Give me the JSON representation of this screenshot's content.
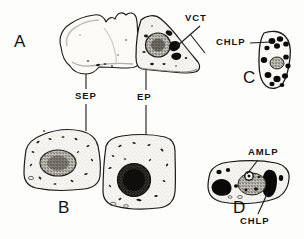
{
  "figure": {
    "caption_present": false,
    "background_color": "#fdfdfc",
    "ink_color": "#141414",
    "panels": [
      {
        "id": "A",
        "letter": "A",
        "letter_x": 14,
        "letter_y": 32,
        "description": "Pair of adjacent epidermal cells in surface view"
      },
      {
        "id": "B",
        "letter": "B",
        "letter_x": 58,
        "letter_y": 198,
        "description": "Subsidiary epidermal cell enlarged"
      },
      {
        "id": "C",
        "letter": "C",
        "letter_x": 243,
        "letter_y": 68,
        "description": "Elongated cell packed with chloroplasts"
      },
      {
        "id": "D",
        "letter": "D",
        "letter_x": 233,
        "letter_y": 198,
        "description": "Elongated cell with amyloplasts and chloroplasts"
      }
    ],
    "labels": [
      {
        "id": "sep",
        "text": "SEP",
        "x": 75,
        "y": 94,
        "leader": "vertical-double"
      },
      {
        "id": "ep",
        "text": "EP",
        "x": 137,
        "y": 96,
        "leader": "vertical-double"
      },
      {
        "id": "vct",
        "text": "VCT",
        "x": 185,
        "y": 14,
        "leader": "diagonal-down-left"
      },
      {
        "id": "chlp-c",
        "text": "CHLP",
        "x": 222,
        "y": 38,
        "leader": "horizontal-right"
      },
      {
        "id": "amlp",
        "text": "AMLP",
        "x": 248,
        "y": 148,
        "leader": "diagonal-down-left"
      },
      {
        "id": "chlp-d",
        "text": "CHLP",
        "x": 243,
        "y": 220,
        "leader": "diagonal-up-right"
      }
    ]
  }
}
